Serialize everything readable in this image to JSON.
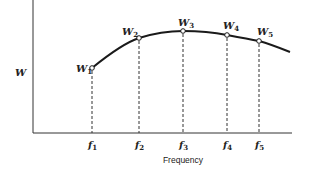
{
  "diagram": {
    "y_axis_label": "W",
    "x_axis_label": "Frequency",
    "points": [
      {
        "label": "W",
        "sub": "1",
        "freq_label": "f",
        "freq_sub": "1",
        "x": 92,
        "y": 68
      },
      {
        "label": "W",
        "sub": "2",
        "freq_label": "f",
        "freq_sub": "2",
        "x": 139,
        "y": 38
      },
      {
        "label": "W",
        "sub": "3",
        "freq_label": "f",
        "freq_sub": "3",
        "x": 183,
        "y": 31
      },
      {
        "label": "W",
        "sub": "4",
        "freq_label": "f",
        "freq_sub": "4",
        "x": 227,
        "y": 35
      },
      {
        "label": "W",
        "sub": "5",
        "freq_label": "f",
        "freq_sub": "5",
        "x": 259,
        "y": 41
      }
    ],
    "curve_end": {
      "x": 290,
      "y": 52
    },
    "colors": {
      "line": "#1a1a1a",
      "background": "#ffffff"
    }
  }
}
